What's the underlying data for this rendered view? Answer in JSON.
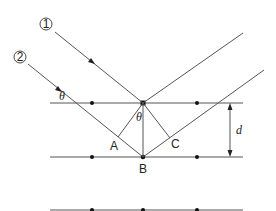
{
  "diagram": {
    "type": "bragg-diffraction",
    "labels": {
      "ray1": "1",
      "ray2": "2",
      "theta_incident": "θ",
      "theta_apex": "θ",
      "point_a": "A",
      "point_b": "B",
      "point_c": "C",
      "spacing": "d"
    },
    "atomic_planes": 3,
    "atoms_per_plane": 3
  }
}
